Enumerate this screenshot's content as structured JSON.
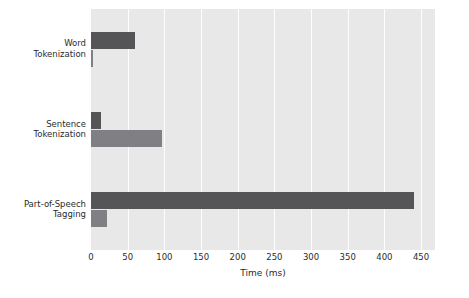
{
  "chart_data": {
    "type": "bar",
    "orientation": "horizontal",
    "title": "",
    "subtitle": "",
    "xlabel": "Time (ms)",
    "ylabel": "",
    "categories": [
      "Word\nTokenization",
      "Sentence\nTokenization",
      "Part-of-Speech\nTagging"
    ],
    "series": [
      {
        "name": "series-1",
        "color": "#555558",
        "values": [
          60,
          13,
          440
        ]
      },
      {
        "name": "series-2",
        "color": "#808084",
        "values": [
          2,
          97,
          22
        ]
      }
    ],
    "xlim": [
      0,
      469
    ],
    "xticks": [
      0,
      50,
      100,
      150,
      200,
      250,
      300,
      350,
      400,
      450
    ],
    "xtick_labels": [
      "0",
      "50",
      "100",
      "150",
      "200",
      "250",
      "300",
      "350",
      "400",
      "450"
    ],
    "grid": true,
    "grid_axis": "x",
    "grid_color": "#fdfdfd",
    "legend": false,
    "plot_background": "#e8e8e8",
    "figure_background": "#ffffff",
    "text_color": "#2b2b2b"
  }
}
